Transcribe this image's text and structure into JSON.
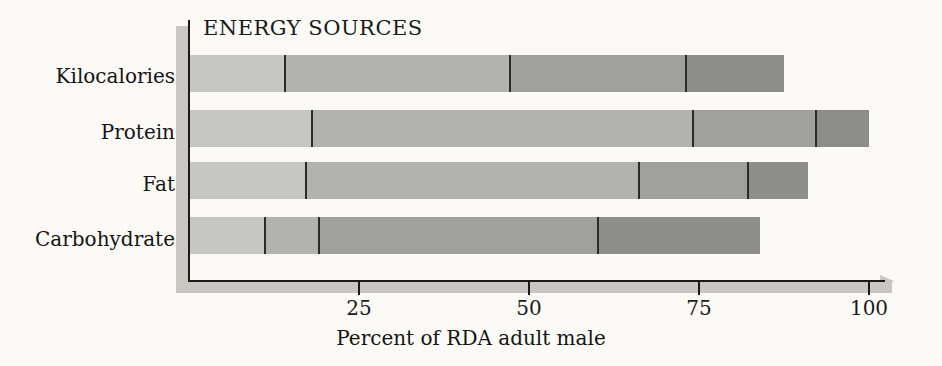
{
  "chart_data": {
    "type": "bar",
    "orientation": "horizontal",
    "stacked": true,
    "title": "ENERGY SOURCES",
    "xlabel": "Percent of RDA adult male",
    "ylabel": "",
    "xlim": [
      0,
      106
    ],
    "xticks": [
      25,
      50,
      75,
      100
    ],
    "xtick_labels": [
      "25",
      "50",
      "75",
      "100"
    ],
    "grid": false,
    "legend": "none",
    "categories": [
      "Kilocalories",
      "Protein",
      "Fat",
      "Carbohydrate"
    ],
    "segment_colors": [
      "#c6c6c3",
      "#b2b2ae",
      "#a0a09c",
      "#8d8d89"
    ],
    "series": [
      {
        "name": "segment-1",
        "values": [
          14,
          18,
          17,
          11
        ]
      },
      {
        "name": "segment-2",
        "values": [
          33,
          56,
          49,
          8
        ]
      },
      {
        "name": "segment-3",
        "values": [
          26,
          18,
          16,
          41
        ]
      },
      {
        "name": "segment-4",
        "values": [
          14.5,
          8,
          9,
          24
        ]
      }
    ],
    "cumulative_boundaries": [
      [
        14,
        47,
        73,
        87.5
      ],
      [
        18,
        74,
        92,
        100
      ],
      [
        17,
        66,
        82,
        91
      ],
      [
        11,
        19,
        60,
        84
      ]
    ],
    "totals": [
      87.5,
      100,
      91,
      84
    ]
  },
  "axis": {
    "origin_value": 0,
    "tick_25": "25",
    "tick_50": "50",
    "tick_75": "75",
    "tick_100": "100"
  },
  "labels": {
    "kilocalories": "Kilocalories",
    "protein": "Protein",
    "fat": "Fat",
    "carbohydrate": "Carbohydrate"
  },
  "colors": {
    "background": "#fbfaf7",
    "axis": "#1a1a1a",
    "axis_shadow": "#c9c7c2",
    "seg1": "#c6c6c3",
    "seg2": "#b2b2ae",
    "seg3": "#a0a09c",
    "seg4": "#8d8d89"
  }
}
